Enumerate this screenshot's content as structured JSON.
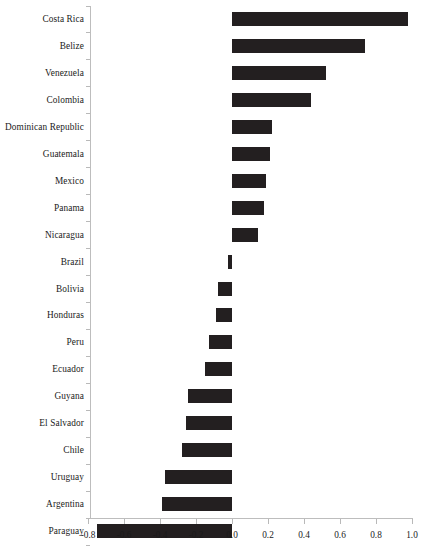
{
  "chart_data": {
    "type": "bar",
    "orientation": "horizontal",
    "title": "",
    "subtitle": "",
    "xlabel": "",
    "ylabel": "",
    "xlim": [
      -0.8,
      1.0
    ],
    "xticks": [
      "-0.8",
      "-0.6",
      "-0.4",
      "-0.2",
      "0.0",
      "0.2",
      "0.4",
      "0.6",
      "0.8",
      "1.0"
    ],
    "xtick_values": [
      -0.8,
      -0.6,
      -0.4,
      -0.2,
      0.0,
      0.2,
      0.4,
      0.6,
      0.8,
      1.0
    ],
    "grid": false,
    "legend": "none",
    "bar_color": "#231f20",
    "axis_color": "#bdbdbd",
    "categories": [
      "Costa Rica",
      "Belize",
      "Venezuela",
      "Colombia",
      "Dominican Republic",
      "Guatemala",
      "Mexico",
      "Panama",
      "Nicaragua",
      "Brazil",
      "Bolivia",
      "Honduras",
      "Peru",
      "Ecuador",
      "Guyana",
      "El Salvador",
      "Chile",
      "Uruguay",
      "Argentina",
      "Paraguay"
    ],
    "values": [
      0.98,
      0.74,
      0.52,
      0.44,
      0.22,
      0.21,
      0.19,
      0.18,
      0.145,
      -0.02,
      -0.08,
      -0.09,
      -0.13,
      -0.15,
      -0.245,
      -0.255,
      -0.28,
      -0.37,
      -0.39,
      -0.75
    ]
  }
}
